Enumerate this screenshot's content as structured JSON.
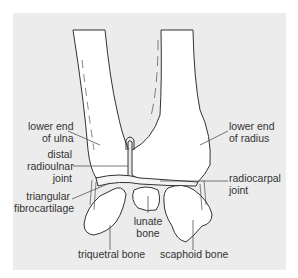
{
  "figure": {
    "background": "#ececec",
    "line_color": "#333333",
    "bone_fill": "#ffffff"
  },
  "labels": {
    "lower_end_ulna": [
      "lower end",
      "of ulna"
    ],
    "distal_radioulnar_joint": [
      "distal",
      "radioulnar",
      "joint"
    ],
    "triangular_fibrocartilage": [
      "triangular",
      "fibrocartilage"
    ],
    "triquetral_bone": [
      "triquetral bone"
    ],
    "lunate_bone": [
      "lunate",
      "bone"
    ],
    "scaphoid_bone": [
      "scaphoid bone"
    ],
    "lower_end_radius": [
      "lower end",
      "of radius"
    ],
    "radiocarpal_joint": [
      "radiocarpal",
      "joint"
    ]
  }
}
